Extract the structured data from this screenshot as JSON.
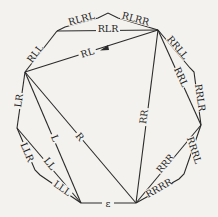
{
  "diagram": {
    "type": "graph",
    "nodes": [
      {
        "id": "A",
        "x": 57,
        "y": 31
      },
      {
        "id": "B",
        "x": 158,
        "y": 30
      },
      {
        "id": "C",
        "x": 25,
        "y": 72
      },
      {
        "id": "D",
        "x": 201,
        "y": 125
      },
      {
        "id": "E",
        "x": 17,
        "y": 128
      },
      {
        "id": "F",
        "x": 81,
        "y": 203
      },
      {
        "id": "G",
        "x": 136,
        "y": 203
      }
    ],
    "labels": {
      "rll": "RLL",
      "rlrl": "RLRL",
      "rlrr": "RLRR",
      "rlr": "RLR",
      "rl": "RL",
      "rrll": "RRLL",
      "rrl": "RRL",
      "rrlr": "RRLR",
      "rr": "RR",
      "rrrl": "RRRL",
      "rrr": "RRR",
      "rrrr": "RRRR",
      "lr": "LR",
      "l": "L",
      "r": "R",
      "ll": "LL",
      "llr": "LLR",
      "lll": "LLL",
      "epsilon": "ε"
    }
  }
}
